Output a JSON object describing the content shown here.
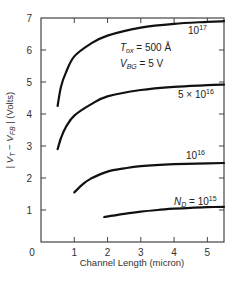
{
  "chart_data": {
    "type": "line",
    "title": "",
    "xlabel": "Channel Length (micron)",
    "ylabel": "| V_T − V_FB | (Volts)",
    "xlim": [
      0,
      5.5
    ],
    "ylim": [
      0,
      7
    ],
    "xticks": [
      0,
      1,
      2,
      3,
      4,
      5
    ],
    "yticks": [
      1,
      2,
      3,
      4,
      5,
      6,
      7
    ],
    "grid": false,
    "annotations": [
      "T_ox = 500 Å",
      "V_BG = 5 V"
    ],
    "series": [
      {
        "name": "10^17",
        "label_text": "10",
        "label_exp": "17",
        "x": [
          0.5,
          0.6,
          0.75,
          1.0,
          1.5,
          2.0,
          3.0,
          4.0,
          5.0,
          5.5
        ],
        "y": [
          4.25,
          4.85,
          5.3,
          5.8,
          6.2,
          6.45,
          6.7,
          6.82,
          6.88,
          6.9
        ]
      },
      {
        "name": "5 × 10^16",
        "label_text": "5 × 10",
        "label_exp": "16",
        "x": [
          0.5,
          0.6,
          0.75,
          1.0,
          1.5,
          2.0,
          3.0,
          4.0,
          5.0,
          5.5
        ],
        "y": [
          2.9,
          3.25,
          3.6,
          3.95,
          4.3,
          4.55,
          4.75,
          4.85,
          4.9,
          4.92
        ]
      },
      {
        "name": "10^16",
        "label_text": "10",
        "label_exp": "16",
        "x": [
          1.0,
          1.25,
          1.5,
          2.0,
          2.5,
          3.0,
          4.0,
          5.0,
          5.5
        ],
        "y": [
          1.55,
          1.8,
          1.98,
          2.2,
          2.3,
          2.37,
          2.43,
          2.46,
          2.47
        ]
      },
      {
        "name": "N_D = 10^15",
        "label_prefix": "N",
        "label_sub": "D",
        "label_text": " = 10",
        "label_exp": "15",
        "x": [
          1.9,
          2.5,
          3.0,
          3.5,
          4.0,
          4.5,
          5.0,
          5.5
        ],
        "y": [
          0.78,
          0.88,
          0.95,
          1.0,
          1.04,
          1.07,
          1.09,
          1.1
        ]
      }
    ]
  },
  "labels": {
    "x_axis_title": "Channel Length (micron)",
    "y_axis_title_parts": {
      "bar_left": "| ",
      "v1": "V",
      "v1_sub": "T",
      "minus": " − ",
      "v2": "V",
      "v2_sub": "FB",
      "bar_right": " |",
      "unit": " (Volts)"
    },
    "tox": {
      "sym": "T",
      "sub": "ox",
      "rest": " = 500 Å"
    },
    "vbg": {
      "sym": "V",
      "sub": "BG",
      "rest": " = 5 V"
    },
    "x_origin": "0"
  }
}
